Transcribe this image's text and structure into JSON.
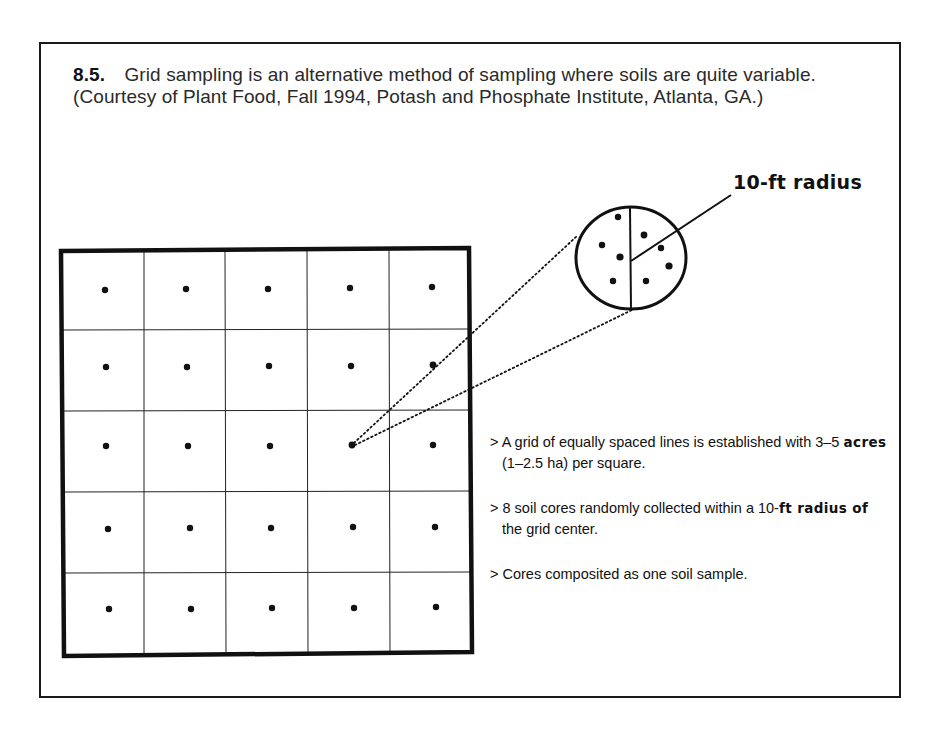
{
  "caption": {
    "figure_number": "8.5.",
    "text": "Grid sampling is an alternative method of sampling where soils are quite variable. (Courtesy of Plant Food, Fall 1994, Potash and Phosphate Institute, Atlanta, GA.)"
  },
  "diagram": {
    "grid": {
      "rows": 5,
      "columns": 5,
      "sample_points_per_cell": 1,
      "highlighted_cell": {
        "row": 3,
        "column": 4
      }
    },
    "inset": {
      "label": "10-ft radius",
      "soil_cores": 8
    }
  },
  "bullets": [
    {
      "prefix": ">",
      "parts": [
        {
          "text": "A grid of equally spaced lines is established with 3–5 ",
          "bold": false
        },
        {
          "text": "acres",
          "bold": true
        },
        {
          "text": " (1–2.5 ha) per square.",
          "bold": false
        }
      ]
    },
    {
      "prefix": ">",
      "parts": [
        {
          "text": "8 soil cores randomly collected within a 10-",
          "bold": false
        },
        {
          "text": "ft radius of",
          "bold": true
        },
        {
          "text": " the grid center.",
          "bold": false
        }
      ]
    },
    {
      "prefix": ">",
      "parts": [
        {
          "text": "Cores composited as one soil sample.",
          "bold": false
        }
      ]
    }
  ],
  "colors": {
    "ink": "#111111",
    "caption_text": "#2a2a2a",
    "background": "#ffffff"
  }
}
